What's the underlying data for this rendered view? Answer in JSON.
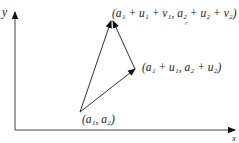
{
  "axes": {
    "x_label": "x",
    "y_label": "y"
  },
  "points": {
    "start": {
      "label": "(a₁,  a₂)"
    },
    "u_tip": {
      "label": "(a₁ + u₁,  a₂ + u₂)"
    },
    "apex": {
      "label": "(a₁ + u₁ + v₁,  a₂ + u₂ + v₂)"
    }
  },
  "mark": "r",
  "colors": {
    "line": "#333333",
    "text": "#222222"
  }
}
